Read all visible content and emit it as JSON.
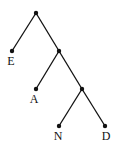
{
  "diagram": {
    "type": "binary-tree",
    "edge_color": "#111111",
    "node_color": "#111111",
    "nodes": [
      {
        "id": "root",
        "x": 36,
        "y": 13,
        "label": ""
      },
      {
        "id": "n1",
        "x": 59,
        "y": 51,
        "label": ""
      },
      {
        "id": "n2",
        "x": 82,
        "y": 89,
        "label": ""
      },
      {
        "id": "E",
        "x": 12,
        "y": 51,
        "label": "E"
      },
      {
        "id": "A",
        "x": 36,
        "y": 89,
        "label": "A"
      },
      {
        "id": "N",
        "x": 59,
        "y": 126,
        "label": "N"
      },
      {
        "id": "D",
        "x": 105,
        "y": 126,
        "label": "D"
      }
    ],
    "edges": [
      [
        "root",
        "E"
      ],
      [
        "root",
        "n1"
      ],
      [
        "n1",
        "A"
      ],
      [
        "n1",
        "n2"
      ],
      [
        "n2",
        "N"
      ],
      [
        "n2",
        "D"
      ]
    ],
    "labels": {
      "E": "E",
      "A": "A",
      "N": "N",
      "D": "D"
    }
  }
}
